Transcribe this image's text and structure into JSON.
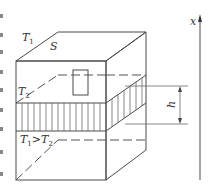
{
  "diagram": {
    "type": "3d-box-cross-section",
    "labels": {
      "top_temperature": {
        "symbol": "T",
        "subscript": "1"
      },
      "top_surface": "S",
      "mid_temperature": {
        "symbol": "T",
        "subscript": "2"
      },
      "relation": {
        "left": "T",
        "left_sub": "1",
        "op": ">",
        "right": "T",
        "right_sub": "2"
      },
      "thickness": "h",
      "axis": "x"
    },
    "colors": {
      "line": "#4a4a4a",
      "hatch": "#6a6a6a",
      "text": "#333333",
      "background": "#ffffff"
    },
    "left_edge_fragments": 9
  }
}
